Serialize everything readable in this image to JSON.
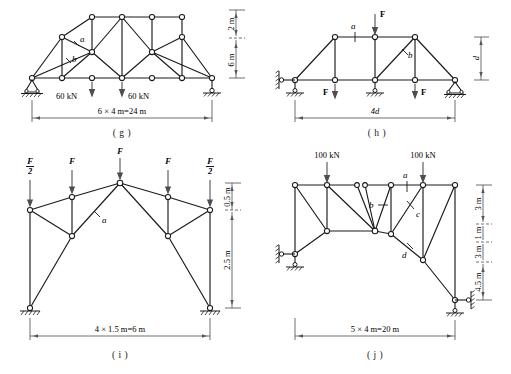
{
  "figure": {
    "panels": [
      {
        "id": "g",
        "caption": "( g )",
        "span_label": "6 × 4 m=24 m",
        "height_labels": [
          "2 m",
          "6 m"
        ],
        "loads": [
          "60 kN",
          "60 kN"
        ],
        "members": [
          "a",
          "b"
        ],
        "supports": [
          "pin",
          "link"
        ]
      },
      {
        "id": "h",
        "caption": "( h )",
        "span_label": "4d",
        "height_labels": [
          "d"
        ],
        "loads": [
          "F",
          "F",
          "F"
        ],
        "members": [
          "a",
          "b"
        ],
        "supports": [
          "pin",
          "roller",
          "pin"
        ]
      },
      {
        "id": "i",
        "caption": "( i )",
        "span_label": "4 × 1.5 m=6 m",
        "height_labels": [
          "0.5 m",
          "2.5 m"
        ],
        "loads": [
          "F/2",
          "F",
          "F",
          "F",
          "F/2"
        ],
        "members": [
          "a"
        ],
        "supports": [
          "fixed",
          "fixed"
        ]
      },
      {
        "id": "j",
        "caption": "( j )",
        "span_label": "5 × 4 m=20 m",
        "height_labels": [
          "3 m",
          "1 m",
          "3 m",
          "4.5 m"
        ],
        "loads": [
          "100 kN",
          "100 kN"
        ],
        "members": [
          "a",
          "b",
          "c",
          "d"
        ],
        "supports": [
          "pin",
          "roller"
        ]
      }
    ]
  },
  "colors": {
    "line": "#1a1a1a",
    "arrow": "#4d4d4d",
    "dim": "#555555",
    "node_fill": "#ffffff"
  }
}
